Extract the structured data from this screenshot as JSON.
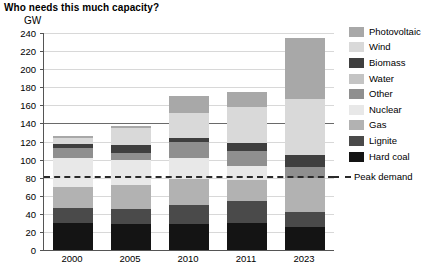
{
  "title": "Who needs this much capacity?",
  "unit_label": "GW",
  "legend": {
    "items": [
      {
        "label": "Photovoltaic",
        "color": "#a8a8a8"
      },
      {
        "label": "Wind",
        "color": "#d9d9d9"
      },
      {
        "label": "Biomass",
        "color": "#3f3f3f"
      },
      {
        "label": "Water",
        "color": "#c4c4c4"
      },
      {
        "label": "Other",
        "color": "#8f8f8f"
      },
      {
        "label": "Nuclear",
        "color": "#e8e8e8"
      },
      {
        "label": "Gas",
        "color": "#b2b2b2"
      },
      {
        "label": "Lignite",
        "color": "#4a4a4a"
      },
      {
        "label": "Hard coal",
        "color": "#141414"
      }
    ],
    "peak_demand_label": "Peak demand"
  },
  "chart_data": {
    "type": "bar",
    "title": "Who needs this much capacity?",
    "xlabel": "",
    "ylabel": "GW",
    "ylim": [
      0,
      240
    ],
    "ytick_step": 20,
    "yticks": [
      0,
      20,
      40,
      60,
      80,
      100,
      120,
      140,
      160,
      180,
      200,
      220,
      240
    ],
    "grid": true,
    "stacked": true,
    "legend_position": "right",
    "categories": [
      "2000",
      "2005",
      "2010",
      "2011",
      "2023"
    ],
    "series": [
      {
        "name": "Hard coal",
        "color": "#141414",
        "values": [
          30,
          29,
          29,
          30,
          26
        ]
      },
      {
        "name": "Lignite",
        "color": "#4a4a4a",
        "values": [
          17,
          16,
          21,
          24,
          16
        ]
      },
      {
        "name": "Gas",
        "color": "#b2b2b2",
        "values": [
          23,
          27,
          28,
          24,
          38
        ]
      },
      {
        "name": "Nuclear",
        "color": "#e8e8e8",
        "values": [
          32,
          28,
          24,
          15,
          0
        ]
      },
      {
        "name": "Other",
        "color": "#8f8f8f",
        "values": [
          11,
          7,
          17,
          17,
          12
        ]
      },
      {
        "name": "Biomass",
        "color": "#3f3f3f",
        "values": [
          4,
          9,
          5,
          8,
          13
        ]
      },
      {
        "name": "Wind",
        "color": "#d9d9d9",
        "values": [
          7,
          19,
          28,
          40,
          62
        ]
      },
      {
        "name": "Photovoltaic",
        "color": "#a8a8a8",
        "values": [
          2,
          2,
          18,
          17,
          67
        ]
      }
    ],
    "totals": [
      126,
      137,
      170,
      175,
      234
    ],
    "annotations": [
      {
        "type": "hline",
        "label": "Peak demand",
        "value": 82,
        "style": "dashed"
      }
    ]
  }
}
